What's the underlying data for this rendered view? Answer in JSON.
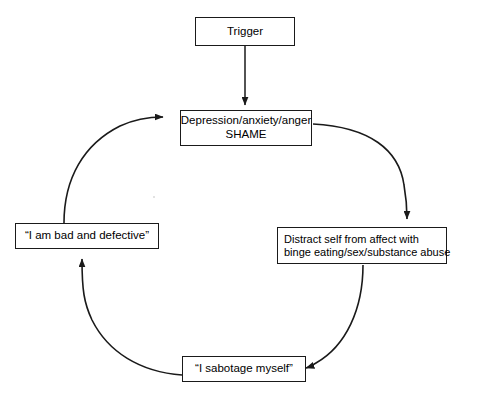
{
  "diagram": {
    "type": "cycle-flowchart",
    "background_color": "#ffffff",
    "line_color": "#1a1a1a",
    "nodes": [
      {
        "id": "trigger",
        "label": "Trigger",
        "lines": [
          "Trigger"
        ]
      },
      {
        "id": "affect",
        "label": "Depression/anxiety/anger SHAME",
        "lines": [
          "Depression/anxiety/anger",
          "SHAME"
        ]
      },
      {
        "id": "distract",
        "label": "Distract self from affect with binge eating/sex/substance abuse",
        "lines": [
          "Distract self from affect with",
          "binge eating/sex/substance abuse"
        ]
      },
      {
        "id": "sabotage",
        "label": "“I sabotage myself”",
        "lines": [
          "“I sabotage myself”"
        ]
      },
      {
        "id": "belief",
        "label": "“I am bad and defective”",
        "lines": [
          "“I am bad and defective”"
        ]
      }
    ],
    "edges": [
      {
        "id": "trigger-to-affect",
        "from": "trigger",
        "to": "affect",
        "style": "straight-arrow-down"
      },
      {
        "id": "affect-to-distract",
        "from": "affect",
        "to": "distract",
        "style": "curved-arrow-clockwise"
      },
      {
        "id": "distract-to-sabotage",
        "from": "distract",
        "to": "sabotage",
        "style": "curved-arrow-clockwise"
      },
      {
        "id": "sabotage-to-belief",
        "from": "sabotage",
        "to": "belief",
        "style": "curved-arrow-clockwise"
      },
      {
        "id": "belief-to-affect",
        "from": "belief",
        "to": "affect",
        "style": "curved-arrow-clockwise"
      }
    ]
  }
}
